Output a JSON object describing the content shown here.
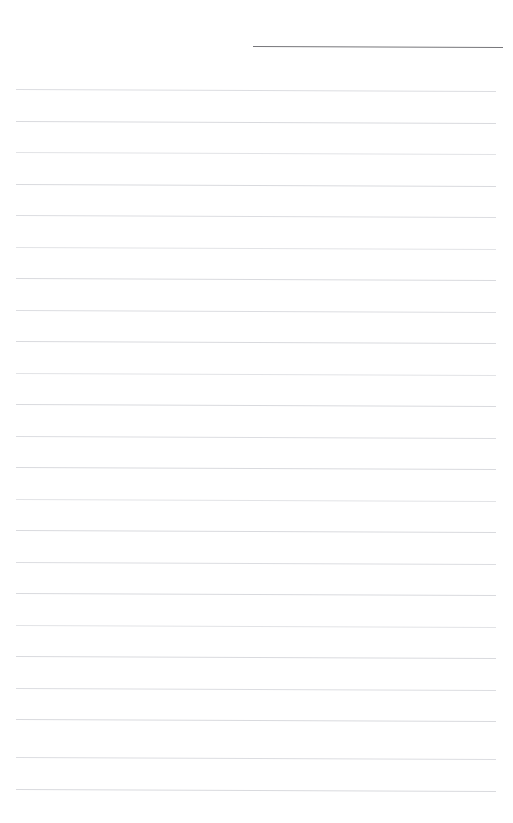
{
  "page": {
    "kind": "blank-ruled-notebook-page",
    "width": 513,
    "height": 823,
    "background_color": "#ffffff",
    "content_text": "",
    "has_handwriting": false
  },
  "date_line": {
    "name": "date-line",
    "color": "#76767a",
    "x_start": 253,
    "x_end": 503,
    "y": 46,
    "thickness": 1.4,
    "slant_px": 1,
    "label": ""
  },
  "ruled_lines": {
    "color": "#d9dade",
    "x_start": 16,
    "x_end": 496,
    "first_y": 89,
    "spacing": 31.5,
    "count": 23,
    "thickness": 1,
    "slant_px": 2,
    "lines": [
      {
        "index": 1,
        "y": 89,
        "shade": "soft",
        "text": ""
      },
      {
        "index": 2,
        "y": 120.5,
        "shade": "",
        "text": ""
      },
      {
        "index": 3,
        "y": 152,
        "shade": "faint",
        "text": ""
      },
      {
        "index": 4,
        "y": 183.5,
        "shade": "",
        "text": ""
      },
      {
        "index": 5,
        "y": 215,
        "shade": "soft",
        "text": ""
      },
      {
        "index": 6,
        "y": 246.5,
        "shade": "faint",
        "text": ""
      },
      {
        "index": 7,
        "y": 278,
        "shade": "",
        "text": ""
      },
      {
        "index": 8,
        "y": 309.5,
        "shade": "soft",
        "text": ""
      },
      {
        "index": 9,
        "y": 341,
        "shade": "",
        "text": ""
      },
      {
        "index": 10,
        "y": 372.5,
        "shade": "faint",
        "text": ""
      },
      {
        "index": 11,
        "y": 404,
        "shade": "",
        "text": ""
      },
      {
        "index": 12,
        "y": 435.5,
        "shade": "soft",
        "text": ""
      },
      {
        "index": 13,
        "y": 467,
        "shade": "",
        "text": ""
      },
      {
        "index": 14,
        "y": 498.5,
        "shade": "faint",
        "text": ""
      },
      {
        "index": 15,
        "y": 530,
        "shade": "",
        "text": ""
      },
      {
        "index": 16,
        "y": 561.5,
        "shade": "soft",
        "text": ""
      },
      {
        "index": 17,
        "y": 593,
        "shade": "",
        "text": ""
      },
      {
        "index": 18,
        "y": 624.5,
        "shade": "faint",
        "text": ""
      },
      {
        "index": 19,
        "y": 656,
        "shade": "",
        "text": ""
      },
      {
        "index": 20,
        "y": 687.5,
        "shade": "soft",
        "text": ""
      },
      {
        "index": 21,
        "y": 719,
        "shade": "",
        "text": ""
      },
      {
        "index": 22,
        "y": 757,
        "shade": "soft",
        "text": ""
      },
      {
        "index": 23,
        "y": 788.5,
        "shade": "",
        "text": ""
      }
    ]
  }
}
